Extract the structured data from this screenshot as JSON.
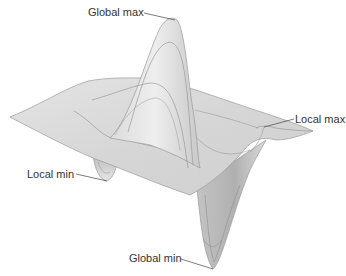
{
  "diagram": {
    "type": "3d-surface-plot",
    "labels": {
      "global_max": "Global max",
      "local_max": "Local max",
      "local_min": "Local min",
      "global_min": "Global min"
    },
    "colors": {
      "surface_fill": "#d9d9d9",
      "surface_light": "#ececec",
      "surface_dark": "#b5b5b5",
      "contour_line": "#8a8a8a",
      "edge_line": "#9a9a9a",
      "leader_line": "#444444",
      "text": "#333333"
    }
  }
}
